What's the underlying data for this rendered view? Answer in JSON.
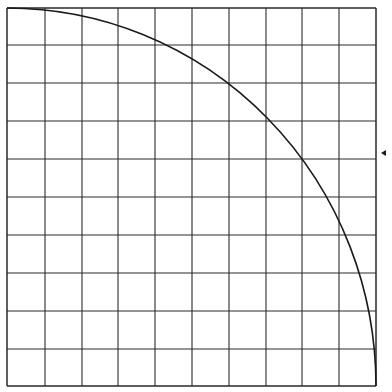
{
  "diagram": {
    "type": "grid-with-quarter-circle",
    "background": "#ffffff",
    "line_color": "#2a2a2a",
    "arc_color": "#1a1a1a",
    "grid": {
      "columns": 10,
      "rows": 10,
      "x_lines": [
        7,
        45,
        82,
        118,
        155,
        192,
        229,
        266,
        302,
        339,
        376
      ],
      "y_lines": [
        8,
        45,
        83,
        121,
        159,
        197,
        235,
        273,
        311,
        349,
        386
      ]
    },
    "arc": {
      "center": [
        7,
        386
      ],
      "radius_x": 369,
      "radius_y": 378,
      "start": [
        7,
        8
      ],
      "end": [
        376,
        386
      ]
    },
    "marker": {
      "shape": "arrowhead-left",
      "position": [
        385,
        153
      ]
    }
  }
}
